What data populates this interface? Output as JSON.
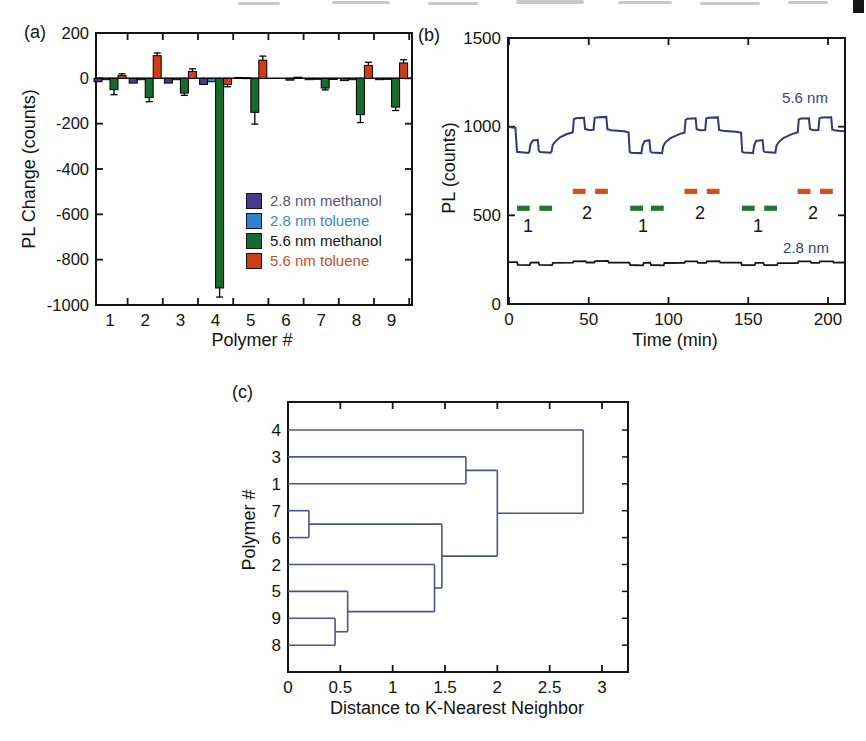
{
  "colors": {
    "axis": "#141414",
    "trace_5_6nm": "#33387a",
    "trace_2_8nm": "#161616",
    "dendrogram_line": "#4d5390",
    "methanol_marker": "#1e7a33",
    "toluene_marker": "#d84f1c",
    "trace_label_text": "#3a3f7d"
  },
  "chart_data": [
    {
      "panel": "a",
      "tag": "(a)",
      "type": "bar",
      "xlabel": "Polymer #",
      "ylabel": "PL Change (counts)",
      "ylim": [
        -1000,
        200
      ],
      "y_ticks": [
        200,
        0,
        -200,
        -400,
        -600,
        -800,
        -1000
      ],
      "categories": [
        "1",
        "2",
        "3",
        "4",
        "5",
        "6",
        "7",
        "8",
        "9"
      ],
      "legend_position": "inside lower-right",
      "series": [
        {
          "name": "2.8 nm methanol",
          "color": "#4a3a8e",
          "text_color": "#56527a",
          "values": [
            -15,
            -21,
            -21,
            -27,
            4,
            0,
            -6,
            -10,
            -6
          ],
          "errors": [
            0,
            0,
            0,
            0,
            0,
            0,
            0,
            0,
            0
          ]
        },
        {
          "name": "2.8 nm toluene",
          "color": "#2e82cf",
          "text_color": "#3f86c9",
          "values": [
            -6,
            -6,
            -6,
            -15,
            3,
            0,
            -4,
            -6,
            -4
          ],
          "errors": [
            0,
            0,
            0,
            0,
            0,
            0,
            0,
            0,
            0
          ]
        },
        {
          "name": "5.6 nm methanol",
          "color": "#176b2e",
          "text_color": "#131313",
          "values": [
            -50,
            -85,
            -65,
            -925,
            -150,
            -8,
            -43,
            -160,
            -127
          ],
          "errors": [
            22,
            18,
            10,
            40,
            52,
            0,
            8,
            35,
            15
          ]
        },
        {
          "name": "5.6 nm toluene",
          "color": "#cf3e17",
          "text_color": "#c8502c",
          "values": [
            12,
            100,
            30,
            -27,
            80,
            5,
            -5,
            57,
            68
          ],
          "errors": [
            8,
            12,
            12,
            10,
            18,
            0,
            0,
            14,
            14
          ]
        }
      ]
    },
    {
      "panel": "b",
      "tag": "(b)",
      "type": "line",
      "xlabel": "Time (min)",
      "ylabel": "PL (counts)",
      "xlim": [
        0,
        210
      ],
      "ylim": [
        0,
        1500
      ],
      "x_ticks": [
        0,
        50,
        100,
        150,
        200
      ],
      "y_ticks": [
        0,
        500,
        1000,
        1500
      ],
      "series": [
        {
          "name": "5.6 nm",
          "color": "#33387a",
          "width": 2,
          "points": [
            [
              0,
              1000
            ],
            [
              4,
              993
            ],
            [
              5,
              858
            ],
            [
              12,
              852
            ],
            [
              12.7,
              857
            ],
            [
              13.4,
              900
            ],
            [
              15,
              922
            ],
            [
              18,
              926
            ],
            [
              18.7,
              864
            ],
            [
              19.5,
              857
            ],
            [
              26,
              853
            ],
            [
              26.7,
              861
            ],
            [
              27.4,
              897
            ],
            [
              29,
              916
            ],
            [
              32,
              940
            ],
            [
              36,
              957
            ],
            [
              39,
              966
            ],
            [
              40,
              969
            ],
            [
              40.7,
              1043
            ],
            [
              42,
              1048
            ],
            [
              47,
              1050
            ],
            [
              47.7,
              987
            ],
            [
              50,
              982
            ],
            [
              53,
              983
            ],
            [
              53.7,
              1050
            ],
            [
              56,
              1053
            ],
            [
              61,
              1055
            ],
            [
              61.7,
              985
            ],
            [
              64,
              980
            ],
            [
              68,
              977
            ],
            [
              72,
              974
            ],
            [
              74,
              970
            ],
            [
              75,
              968
            ],
            [
              75.7,
              857
            ],
            [
              76.5,
              853
            ],
            [
              83,
              851
            ],
            [
              83.7,
              893
            ],
            [
              85,
              918
            ],
            [
              88,
              923
            ],
            [
              88.7,
              860
            ],
            [
              89.5,
              855
            ],
            [
              96,
              851
            ],
            [
              96.7,
              890
            ],
            [
              98,
              910
            ],
            [
              101,
              934
            ],
            [
              105,
              951
            ],
            [
              108,
              962
            ],
            [
              110,
              966
            ],
            [
              110.7,
              1039
            ],
            [
              112,
              1045
            ],
            [
              117,
              1047
            ],
            [
              117.7,
              985
            ],
            [
              120,
              980
            ],
            [
              123,
              981
            ],
            [
              123.7,
              1047
            ],
            [
              125,
              1050
            ],
            [
              131,
              1052
            ],
            [
              131.7,
              982
            ],
            [
              134,
              977
            ],
            [
              138,
              974
            ],
            [
              142,
              971
            ],
            [
              144,
              968
            ],
            [
              145.5,
              965
            ],
            [
              146.2,
              859
            ],
            [
              147,
              855
            ],
            [
              153,
              852
            ],
            [
              153.7,
              895
            ],
            [
              155,
              920
            ],
            [
              159,
              924
            ],
            [
              159.7,
              863
            ],
            [
              160.5,
              857
            ],
            [
              167,
              853
            ],
            [
              167.7,
              893
            ],
            [
              169,
              912
            ],
            [
              172,
              936
            ],
            [
              176,
              952
            ],
            [
              179,
              963
            ],
            [
              181,
              967
            ],
            [
              181.7,
              1041
            ],
            [
              183,
              1046
            ],
            [
              188,
              1048
            ],
            [
              188.7,
              986
            ],
            [
              191,
              980
            ],
            [
              194,
              981
            ],
            [
              194.7,
              1048
            ],
            [
              196,
              1051
            ],
            [
              202,
              1053
            ],
            [
              202.7,
              983
            ],
            [
              205,
              978
            ],
            [
              208,
              975
            ],
            [
              210,
              974
            ]
          ]
        },
        {
          "name": "2.8 nm",
          "color": "#161616",
          "width": 1.8,
          "points": [
            [
              0,
              236
            ],
            [
              5,
              236
            ],
            [
              5.5,
              221
            ],
            [
              13,
              219
            ],
            [
              13.5,
              233
            ],
            [
              18.5,
              234
            ],
            [
              19,
              221
            ],
            [
              27,
              219
            ],
            [
              27.5,
              232
            ],
            [
              40,
              233
            ],
            [
              40.5,
              241
            ],
            [
              48,
              242
            ],
            [
              48.5,
              234
            ],
            [
              53.5,
              234
            ],
            [
              54,
              242
            ],
            [
              62,
              243
            ],
            [
              62.5,
              234
            ],
            [
              75.5,
              233
            ],
            [
              76,
              220
            ],
            [
              84,
              218
            ],
            [
              84.5,
              232
            ],
            [
              88.5,
              233
            ],
            [
              89,
              220
            ],
            [
              97,
              218
            ],
            [
              97.5,
              231
            ],
            [
              110,
              232
            ],
            [
              110.5,
              240
            ],
            [
              118,
              241
            ],
            [
              118.5,
              232
            ],
            [
              123.5,
              232
            ],
            [
              124,
              241
            ],
            [
              132,
              242
            ],
            [
              132.5,
              233
            ],
            [
              145.5,
              233
            ],
            [
              146,
              220
            ],
            [
              154,
              219
            ],
            [
              154.5,
              232
            ],
            [
              159.5,
              232
            ],
            [
              160,
              220
            ],
            [
              168,
              219
            ],
            [
              168.5,
              230
            ],
            [
              181,
              231
            ],
            [
              181.5,
              240
            ],
            [
              189,
              241
            ],
            [
              189.5,
              232
            ],
            [
              194.5,
              232
            ],
            [
              195,
              240
            ],
            [
              203,
              241
            ],
            [
              203.5,
              233
            ],
            [
              210,
              234
            ]
          ]
        }
      ],
      "pulse_markers": [
        {
          "solvent": "methanol",
          "label": "1",
          "color": "#1e7a33",
          "y": 540,
          "intervals": [
            [
              5,
              13
            ],
            [
              19,
              27
            ],
            [
              76,
              84
            ],
            [
              89,
              97
            ],
            [
              146,
              154
            ],
            [
              160,
              168
            ]
          ],
          "label_xs": [
            11.9,
            84,
            156.1
          ],
          "label_y": 440
        },
        {
          "solvent": "toluene",
          "label": "2",
          "color": "#d84f1c",
          "y": 635,
          "intervals": [
            [
              40,
              48
            ],
            [
              54,
              62
            ],
            [
              110,
              118
            ],
            [
              124,
              132
            ],
            [
              181,
              189
            ],
            [
              195,
              203
            ]
          ],
          "label_xs": [
            48.9,
            119.7,
            190.6
          ],
          "label_y": 512
        }
      ]
    },
    {
      "panel": "c",
      "tag": "(c)",
      "type": "dendrogram",
      "xlabel": "Distance to K-Nearest Neighbor",
      "ylabel": "Polymer #",
      "xlim": [
        0,
        3.25
      ],
      "x_ticks": [
        0,
        0.5,
        1,
        1.5,
        2,
        2.5,
        3
      ],
      "leaves": [
        "4",
        "3",
        "1",
        "7",
        "6",
        "2",
        "5",
        "9",
        "8"
      ],
      "tree": {
        "d": 2.82,
        "children": [
          "4",
          {
            "d": 2.0,
            "children": [
              {
                "d": 1.7,
                "children": [
                  "3",
                  "1"
                ]
              },
              {
                "d": 1.47,
                "children": [
                  {
                    "d": 0.2,
                    "children": [
                      "7",
                      "6"
                    ]
                  },
                  {
                    "d": 1.4,
                    "children": [
                      "2",
                      {
                        "d": 0.57,
                        "children": [
                          "5",
                          {
                            "d": 0.45,
                            "children": [
                              "9",
                              "8"
                            ]
                          }
                        ]
                      }
                    ]
                  }
                ]
              }
            ]
          }
        ]
      }
    }
  ]
}
